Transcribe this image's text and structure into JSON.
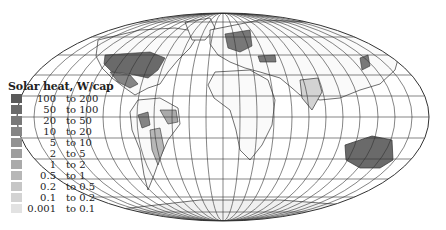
{
  "map": {
    "projection": "elliptical equal-area world map with graticule",
    "title": "Solar heat, W/cap",
    "highlighted_regions": [
      {
        "name": "United States",
        "class": "50 to 100"
      },
      {
        "name": "Mexico",
        "class": "10 to 20"
      },
      {
        "name": "Western Europe",
        "class": "20 to 50"
      },
      {
        "name": "Turkey",
        "class": "20 to 50"
      },
      {
        "name": "Israel",
        "class": "50 to 100"
      },
      {
        "name": "India",
        "class": "0.1 to 0.2"
      },
      {
        "name": "Brazil (east)",
        "class": "1 to 2"
      },
      {
        "name": "Peru",
        "class": "10 to 20"
      },
      {
        "name": "Argentina",
        "class": "0.5 to 1"
      },
      {
        "name": "Japan",
        "class": "20 to 50"
      },
      {
        "name": "Australia",
        "class": "50 to 100"
      }
    ]
  },
  "legend": {
    "title": "Solar heat, W/cap",
    "connector": "to",
    "items": [
      {
        "from": "100",
        "to": "200",
        "color": "#5a5a5a"
      },
      {
        "from": "50",
        "to": "100",
        "color": "#6a6a6a"
      },
      {
        "from": "20",
        "to": "50",
        "color": "#787878"
      },
      {
        "from": "10",
        "to": "20",
        "color": "#858585"
      },
      {
        "from": "5",
        "to": "10",
        "color": "#929292"
      },
      {
        "from": "2",
        "to": "5",
        "color": "#9e9e9e"
      },
      {
        "from": "1",
        "to": "2",
        "color": "#aaaaaa"
      },
      {
        "from": "0.5",
        "to": "1",
        "color": "#b7b7b7"
      },
      {
        "from": "0.2",
        "to": "0.5",
        "color": "#c6c6c6"
      },
      {
        "from": "0.1",
        "to": "0.2",
        "color": "#d3d3d3"
      },
      {
        "from": "0.001",
        "to": "0.1",
        "color": "#e2e2e2"
      }
    ]
  }
}
